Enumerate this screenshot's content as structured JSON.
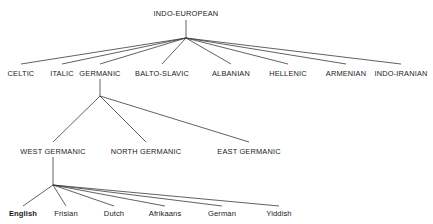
{
  "figure": {
    "name": "indo-european-language-family-tree",
    "background_color": "#ffffff",
    "line_color": "#3a3a3a",
    "text_color": "#1a1a1a"
  },
  "tree": {
    "root": {
      "label": "INDO-EUROPEAN",
      "x": 186,
      "y": 16,
      "anchor": "middle",
      "stem_top": 20,
      "fan_x": 186,
      "fan_y": 38
    },
    "branches": [
      {
        "label": "CELTIC",
        "x": 21,
        "y": 76,
        "tip_y": 64
      },
      {
        "label": "ITALIC",
        "x": 62,
        "y": 76,
        "tip_y": 64
      },
      {
        "label": "GERMANIC",
        "x": 100,
        "y": 76,
        "tip_y": 64
      },
      {
        "label": "BALTO-SLAVIC",
        "x": 162,
        "y": 76,
        "tip_y": 64
      },
      {
        "label": "ALBANIAN",
        "x": 231,
        "y": 76,
        "tip_y": 64
      },
      {
        "label": "HELLENIC",
        "x": 288,
        "y": 76,
        "tip_y": 64
      },
      {
        "label": "ARMENIAN",
        "x": 346,
        "y": 76,
        "tip_y": 64
      },
      {
        "label": "INDO-IRANIAN",
        "x": 401,
        "y": 76,
        "tip_y": 64
      }
    ],
    "germanic": {
      "parent_label": "GERMANIC",
      "stem_top": 79,
      "fan_x": 100,
      "fan_y": 96,
      "children": [
        {
          "label": "WEST GERMANIC",
          "x": 53,
          "y": 154,
          "tip_y": 142
        },
        {
          "label": "NORTH GERMANIC",
          "x": 146,
          "y": 154,
          "tip_y": 142
        },
        {
          "label": "EAST GERMANIC",
          "x": 249,
          "y": 154,
          "tip_y": 142
        }
      ]
    },
    "west_germanic": {
      "parent_label": "WEST GERMANIC",
      "stem_top": 157,
      "fan_x": 53,
      "fan_y": 185,
      "children": [
        {
          "label": "English",
          "x": 23,
          "y": 216,
          "tip_y": 206,
          "highlight": true
        },
        {
          "label": "Frisian",
          "x": 66,
          "y": 216,
          "tip_y": 206,
          "highlight": false
        },
        {
          "label": "Dutch",
          "x": 114,
          "y": 216,
          "tip_y": 206,
          "highlight": false
        },
        {
          "label": "Afrikaans",
          "x": 165,
          "y": 216,
          "tip_y": 206,
          "highlight": false
        },
        {
          "label": "German",
          "x": 222,
          "y": 216,
          "tip_y": 206,
          "highlight": false
        },
        {
          "label": "Yiddish",
          "x": 279,
          "y": 216,
          "tip_y": 206,
          "highlight": false
        }
      ]
    }
  }
}
